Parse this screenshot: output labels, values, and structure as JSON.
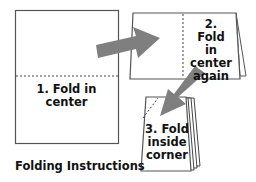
{
  "diagram": {
    "caption": "Folding Instructions",
    "steps": [
      {
        "number": "1.",
        "label": "1. Fold in center"
      },
      {
        "number": "2.",
        "label": "2. Fold in center again",
        "lines": [
          "2. Fold",
          "in",
          "center",
          "again"
        ]
      },
      {
        "number": "3.",
        "label": "3. Fold inside corner",
        "lines": [
          "3. Fold",
          "inside",
          "corner"
        ]
      }
    ],
    "arrows": [
      {
        "from": "step-1",
        "to": "step-2",
        "color": "#7f7f7f"
      },
      {
        "from": "step-2",
        "to": "step-3",
        "color": "#7f7f7f"
      }
    ],
    "colors": {
      "outline": "#555555",
      "arrow": "#7f7f7f",
      "text": "#111111"
    }
  }
}
